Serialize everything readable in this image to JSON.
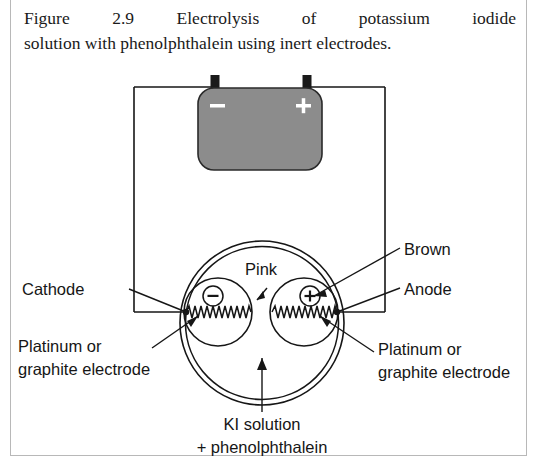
{
  "figure": {
    "caption_line_1": "Figure 2.9   Electrolysis of potassium iodide",
    "caption_line_2": "solution with phenolphthalein using inert electrodes.",
    "caption_full": "Figure 2.9 Electrolysis of potassium iodide solution with phenolphthalein using inert electrodes."
  },
  "battery": {
    "negative_sign": "–",
    "positive_sign": "+",
    "body_color": "#8c8c8c",
    "terminal_color": "#1a1a1a"
  },
  "electrodes": {
    "cathode_charge": "–",
    "anode_charge": "+"
  },
  "labels": {
    "cathode": "Cathode",
    "anode": "Anode",
    "pink": "Pink",
    "brown": "Brown",
    "platinum_left_line_1": "Platinum or",
    "platinum_left_line_2": "graphite electrode",
    "platinum_right_line_1": "Platinum or",
    "platinum_right_line_2": "graphite electrode",
    "solution_line_1": "KI solution",
    "solution_line_2": "+ phenolphthalein"
  },
  "colors": {
    "ink": "#161616",
    "battery_fill": "#8c8c8c",
    "page_border": "#b8b8b8",
    "background": "#ffffff"
  }
}
